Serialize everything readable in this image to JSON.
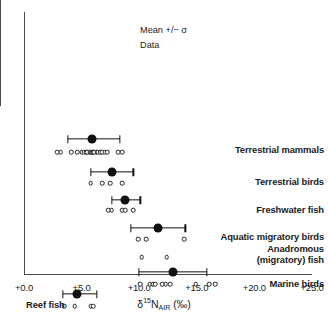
{
  "chart_data": {
    "type": "scatter",
    "title": "",
    "xlabel": "d15N_AIR (per mil)",
    "ylabel": "",
    "xlim": [
      0,
      25
    ],
    "xtick_step_major": 5,
    "xtick_step_minor": 1,
    "xticklabels": [
      "+0.0",
      "+5.0",
      "+10.0",
      "+15.0",
      "+20.0",
      "+25.0"
    ],
    "xtickvalues": [
      0,
      5,
      10,
      15,
      20,
      25
    ],
    "grid": false,
    "legend_position": "top-center-inside",
    "legend": [
      {
        "key": "mean",
        "label": "Mean +/− σ"
      },
      {
        "key": "data",
        "label": "Data"
      }
    ],
    "series": [
      {
        "name": "Terrestrial mammals",
        "label_side": "right",
        "mean": 5.9,
        "sd_low": 3.8,
        "sd_high": 8.3,
        "values": [
          2.9,
          3.2,
          4.1,
          4.6,
          5.0,
          5.2,
          5.4,
          5.5,
          5.7,
          5.8,
          5.9,
          6.0,
          6.1,
          6.3,
          6.4,
          6.6,
          6.8,
          7.0,
          7.2,
          8.2,
          8.5
        ]
      },
      {
        "name": "Terrestrial birds",
        "label_side": "right",
        "mean": 7.6,
        "sd_low": 5.8,
        "sd_high": 9.5,
        "values": [
          5.8,
          6.8,
          7.5,
          8.5
        ]
      },
      {
        "name": "Freshwater fish",
        "label_side": "right",
        "mean": 8.8,
        "sd_low": 7.6,
        "sd_high": 10.1,
        "values": [
          7.3,
          7.6,
          8.5,
          8.8,
          9.5
        ]
      },
      {
        "name": "Aquatic migratory birds",
        "label_side": "right",
        "mean": 11.6,
        "sd_low": 9.3,
        "sd_high": 14.0,
        "values": [
          9.9,
          10.6,
          13.9
        ]
      },
      {
        "name": "Anadromous (migratory) fish",
        "label_side": "right",
        "label_line1": "Anadromous",
        "label_line2": "(migratory) fish",
        "mean": null,
        "sd_low": null,
        "sd_high": null,
        "values": [
          10.2,
          12.4
        ]
      },
      {
        "name": "Marine birds",
        "label_side": "right",
        "mean": 12.9,
        "sd_low": 10.0,
        "sd_high": 15.9,
        "values": [
          10.1,
          10.9,
          11.2,
          11.4,
          12.0,
          12.3,
          12.7,
          14.9,
          16.1,
          16.6
        ]
      },
      {
        "name": "Reef fish",
        "label_side": "left",
        "mean": 4.6,
        "sd_low": 3.4,
        "sd_high": 6.3,
        "values": [
          3.5,
          4.4,
          5.8,
          6.0
        ]
      },
      {
        "name": "Marine fish",
        "label_side": "left",
        "mean": 13.9,
        "sd_low": 12.2,
        "sd_high": 15.5,
        "values": [
          11.6,
          11.8,
          12.4,
          13.3,
          13.6,
          13.8,
          14.0,
          14.9
        ]
      },
      {
        "name": "Marine mammals",
        "label_side": "left",
        "mean": 13.9,
        "sd_low": 12.4,
        "sd_high": 15.2,
        "values": [
          11.6,
          11.8,
          12.0,
          12.2,
          12.7,
          13.1,
          13.3,
          13.5,
          13.7,
          13.9,
          14.1,
          14.3,
          14.5,
          14.7,
          14.9,
          15.1,
          19.3,
          23.4
        ]
      }
    ]
  },
  "axis": {
    "x_title_delta": "δ",
    "x_title_sup": "15",
    "x_title_n": "N",
    "x_title_sub": "AIR",
    "x_title_unit": "(‰)"
  }
}
